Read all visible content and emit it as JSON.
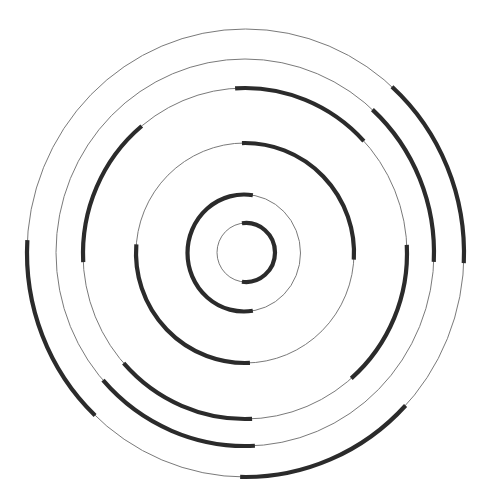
{
  "diagram": {
    "type": "concentric-circle-maze",
    "width": 487,
    "height": 500,
    "colors": {
      "background": "#ffffff",
      "thin_ring": "#7a7a7a",
      "thick_arc": "#2b2b2b"
    },
    "rings": [
      {
        "id": 1,
        "cx": 246,
        "cy": 252.5,
        "rx": 29,
        "ry": 29.5,
        "thick_arcs": [
          {
            "start_deg": -98,
            "end_deg": 98
          }
        ]
      },
      {
        "id": 2,
        "cx": 244,
        "cy": 253,
        "rx": 56.5,
        "ry": 58.5,
        "thick_arcs": [
          {
            "start_deg": 81,
            "end_deg": 279
          }
        ]
      },
      {
        "id": 3,
        "cx": 245,
        "cy": 253,
        "rx": 109,
        "ry": 110,
        "thick_arcs": [
          {
            "start_deg": -91.6,
            "end_deg": 3.4
          },
          {
            "start_deg": 87.4,
            "end_deg": 184.5
          }
        ]
      },
      {
        "id": 4,
        "cx": 245,
        "cy": 253.5,
        "rx": 162,
        "ry": 165.5,
        "thick_arcs": [
          {
            "start_deg": -93.5,
            "end_deg": -42.8
          },
          {
            "start_deg": -3,
            "end_deg": 49
          },
          {
            "start_deg": 87.5,
            "end_deg": 138.5
          },
          {
            "start_deg": 177,
            "end_deg": 230.4
          }
        ]
      },
      {
        "id": 5,
        "cx": 245,
        "cy": 252.5,
        "rx": 189,
        "ry": 193.5,
        "thick_arcs": [
          {
            "start_deg": -47.6,
            "end_deg": 2.8
          },
          {
            "start_deg": 87,
            "end_deg": 138.7
          }
        ]
      },
      {
        "id": 6,
        "cx": 245.5,
        "cy": 253,
        "rx": 218.5,
        "ry": 224,
        "thick_arcs": [
          {
            "start_deg": -47.9,
            "end_deg": 2.6
          },
          {
            "start_deg": 42.9,
            "end_deg": 91.4
          },
          {
            "start_deg": 133.5,
            "end_deg": 183.3
          }
        ]
      }
    ]
  }
}
